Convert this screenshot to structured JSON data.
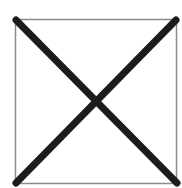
{
  "figure": {
    "shape": "square-with-x",
    "colors": {
      "background": "#ffffff",
      "square_stroke": "#8a8a8a",
      "x_stroke": "#1c1c1c"
    }
  }
}
